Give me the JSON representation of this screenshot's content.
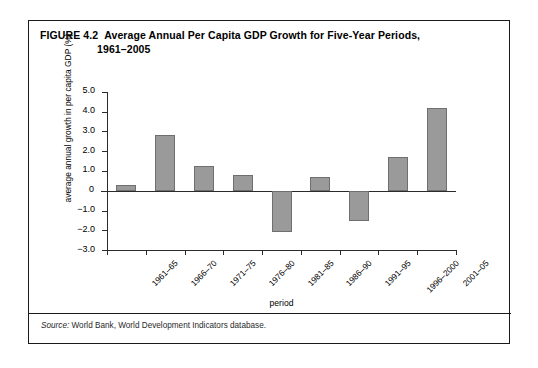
{
  "figure": {
    "number": "FIGURE 4.2",
    "title_line1": "Average Annual Per Capita GDP Growth for Five-Year Periods,",
    "title_line2": "1961–2005",
    "source_prefix": "Source:",
    "source_text": " World Bank, World Development Indicators database."
  },
  "colors": {
    "bar_fill": "#9a9a9a",
    "bar_stroke": "#6f6f6f",
    "axis": "#2b2b2b",
    "frame": "#1a1a1a"
  },
  "chart_data": {
    "type": "bar",
    "title": "Average Annual Per Capita GDP Growth for Five-Year Periods, 1961–2005",
    "xlabel": "period",
    "ylabel": "average annual growth in per capita GDP (%)",
    "categories": [
      "1961–65",
      "1966–70",
      "1971–75",
      "1976–80",
      "1981–85",
      "1986–90",
      "1991–95",
      "1996–2000",
      "2001–05"
    ],
    "values": [
      0.3,
      2.8,
      1.25,
      0.8,
      -2.1,
      0.7,
      -1.5,
      1.7,
      4.2
    ],
    "ylim": [
      -3.0,
      5.0
    ],
    "ytick_values": [
      5.0,
      4.0,
      3.0,
      2.0,
      1.0,
      0.0,
      -1.0,
      -2.0,
      -3.0
    ],
    "ytick_labels": [
      "5.0",
      "4.0",
      "3.0",
      "2.0",
      "1.0",
      "0",
      "−1.0",
      "−2.0",
      "−3.0"
    ],
    "grid": false,
    "legend": null
  }
}
